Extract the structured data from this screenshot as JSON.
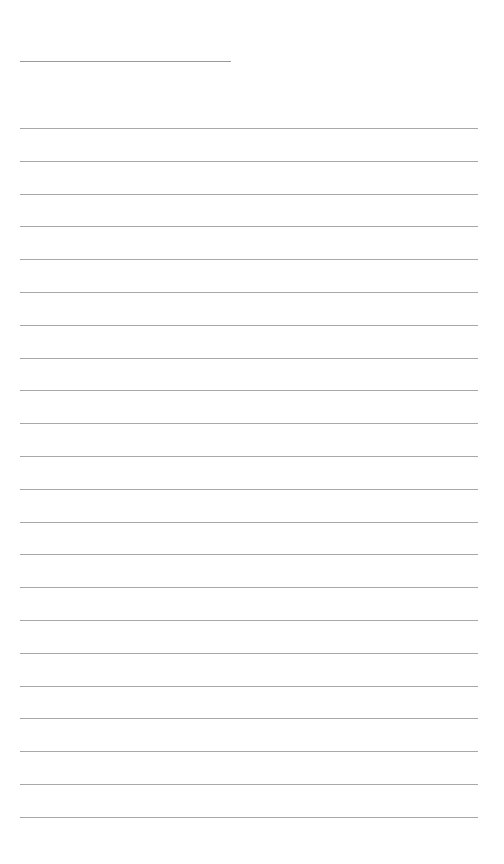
{
  "page": {
    "type": "lined-paper",
    "background": "#ffffff",
    "line_color": "#a8a8a8",
    "header_line": {
      "left": 20,
      "top": 61,
      "width": 211
    },
    "rules": {
      "count": 22,
      "left": 20,
      "width": 458,
      "first_top": 128,
      "spacing": 32.8
    }
  }
}
